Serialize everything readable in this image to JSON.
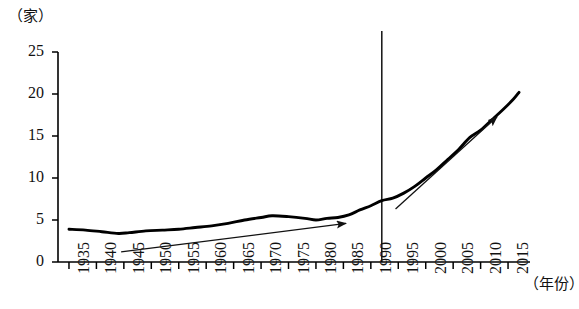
{
  "chart_data": {
    "type": "line",
    "title": "",
    "subtitle": "",
    "xlabel": "（年份）",
    "ylabel": "（家）",
    "xlim": [
      1933,
      2019
    ],
    "ylim": [
      0,
      25
    ],
    "grid": false,
    "legend": "none",
    "y_ticks": [
      0,
      5,
      10,
      15,
      20,
      25
    ],
    "y_tick_labels": [
      "0",
      "5",
      "10",
      "15",
      "20",
      "25"
    ],
    "x_ticks": [
      1935,
      1940,
      1945,
      1950,
      1955,
      1960,
      1965,
      1970,
      1975,
      1980,
      1985,
      1990,
      1995,
      2000,
      2005,
      2010,
      2015
    ],
    "x_tick_labels": [
      "1935",
      "1940",
      "1945",
      "1950",
      "1955",
      "1960",
      "1965",
      "1970",
      "1975",
      "1980",
      "1985",
      "1990",
      "1995",
      "2000",
      "2005",
      "2010",
      "2015"
    ],
    "series": [
      {
        "name": "数量",
        "color": "#000000",
        "x": [
          1935,
          1938,
          1941,
          1944,
          1946,
          1949,
          1952,
          1955,
          1958,
          1961,
          1964,
          1967,
          1970,
          1972,
          1975,
          1978,
          1980,
          1982,
          1984,
          1986,
          1988,
          1990,
          1992,
          1994,
          1996,
          1998,
          2000,
          2002,
          2004,
          2006,
          2008,
          2010,
          2012,
          2014,
          2016,
          2017
        ],
        "values": [
          3.9,
          3.8,
          3.6,
          3.4,
          3.5,
          3.7,
          3.8,
          3.9,
          4.1,
          4.3,
          4.6,
          5.0,
          5.3,
          5.5,
          5.4,
          5.2,
          5.0,
          5.2,
          5.3,
          5.6,
          6.2,
          6.7,
          7.3,
          7.6,
          8.2,
          9.0,
          10.0,
          11.0,
          12.2,
          13.4,
          14.8,
          15.7,
          16.9,
          18.1,
          19.4,
          20.2
        ]
      }
    ],
    "annotations": [
      {
        "name": "trend-arrow-left",
        "type": "arrow",
        "x_start": 1944.5,
        "y_start": 1.2,
        "x_end": 1985.5,
        "y_end": 4.6
      },
      {
        "name": "trend-arrow-right",
        "type": "arrow",
        "x_start": 1994.5,
        "y_start": 6.3,
        "x_end": 2013.0,
        "y_end": 17.3
      },
      {
        "name": "divider-1992",
        "type": "vline",
        "x": 1992.0,
        "y_top": 27.5,
        "y_bottom": 0
      }
    ]
  }
}
